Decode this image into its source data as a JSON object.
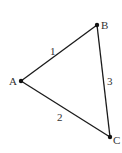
{
  "diagram": {
    "type": "graph",
    "nodes": [
      {
        "id": "A",
        "label": "A",
        "x": 21,
        "y": 81
      },
      {
        "id": "B",
        "label": "B",
        "x": 97,
        "y": 25
      },
      {
        "id": "C",
        "label": "C",
        "x": 110,
        "y": 137
      }
    ],
    "edges": [
      {
        "from": "A",
        "to": "B",
        "label": "1"
      },
      {
        "from": "A",
        "to": "C",
        "label": "2"
      },
      {
        "from": "B",
        "to": "C",
        "label": "3"
      }
    ],
    "colors": {
      "line": "#1a1a1a",
      "text": "#333333",
      "background": "#ffffff"
    }
  }
}
